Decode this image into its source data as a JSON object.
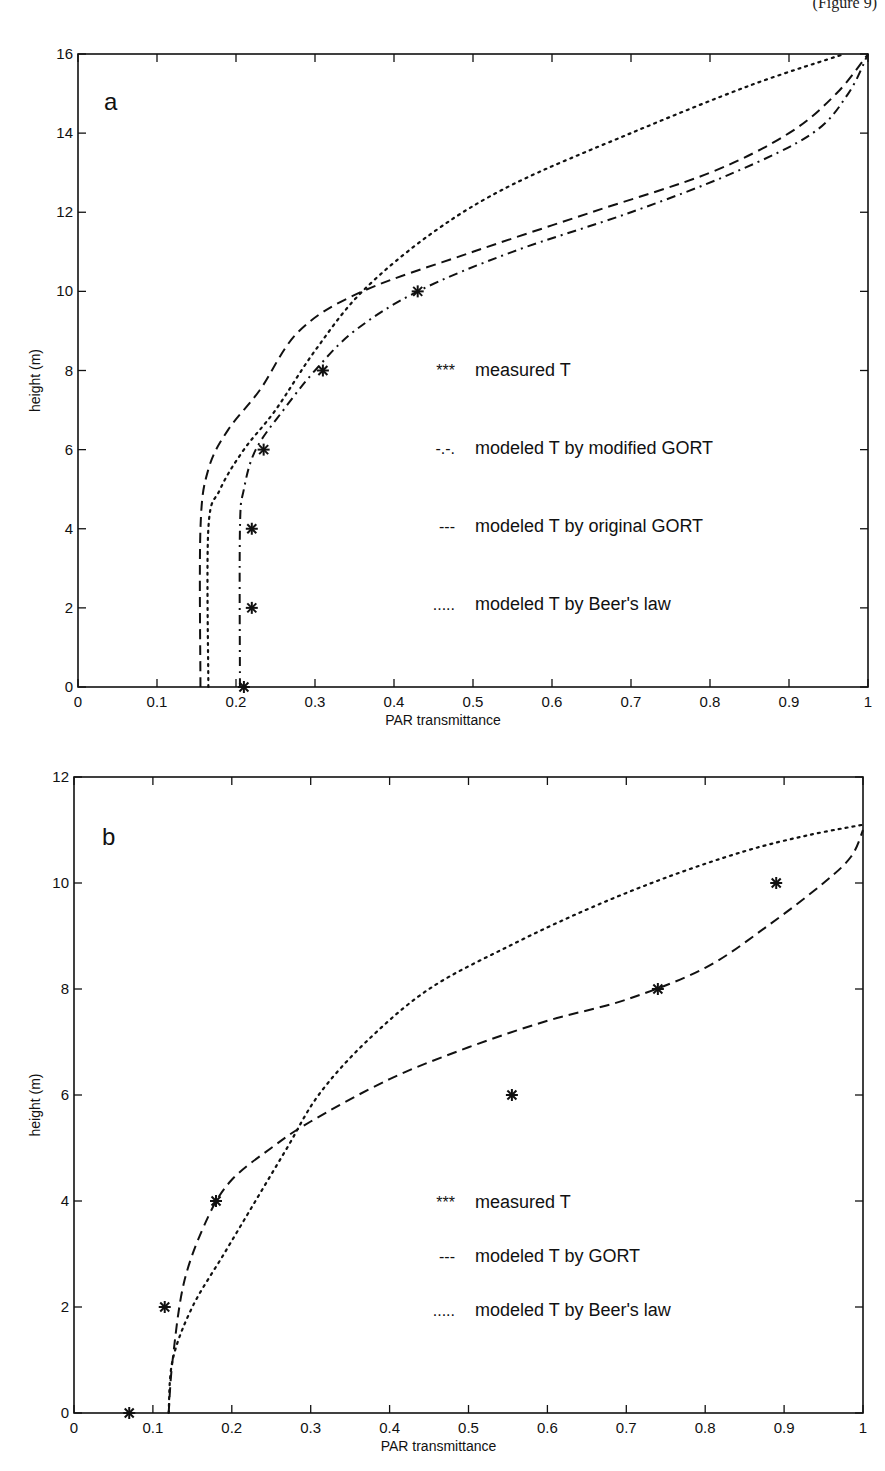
{
  "page": {
    "header_fragment": "(Figure 9)"
  },
  "chart_data": [
    {
      "type": "line",
      "panel_label": "a",
      "title": "",
      "xlabel": "PAR transmittance",
      "ylabel": "height (m)",
      "xlim": [
        0,
        1
      ],
      "ylim": [
        0,
        16
      ],
      "xticks": [
        "0",
        "0.1",
        "0.2",
        "0.3",
        "0.4",
        "0.5",
        "0.6",
        "0.7",
        "0.8",
        "0.9",
        "1"
      ],
      "yticks": [
        "0",
        "2",
        "4",
        "6",
        "8",
        "10",
        "12",
        "14",
        "16"
      ],
      "grid": false,
      "legend_position": "center-right",
      "series": [
        {
          "name": "measured T",
          "legend_symbol": "***",
          "style": "markers-asterisk",
          "points": [
            [
              0.21,
              0
            ],
            [
              0.22,
              2
            ],
            [
              0.22,
              4
            ],
            [
              0.235,
              6
            ],
            [
              0.31,
              8
            ],
            [
              0.43,
              10
            ]
          ]
        },
        {
          "name": "modeled T by modified GORT",
          "legend_symbol": "-.-.",
          "style": "dashdot",
          "points": [
            [
              0.205,
              0
            ],
            [
              0.205,
              4
            ],
            [
              0.21,
              5
            ],
            [
              0.225,
              6
            ],
            [
              0.26,
              7
            ],
            [
              0.3,
              8
            ],
            [
              0.35,
              9
            ],
            [
              0.43,
              10
            ],
            [
              0.55,
              11
            ],
            [
              0.7,
              12
            ],
            [
              0.83,
              13
            ],
            [
              0.93,
              14
            ],
            [
              0.975,
              15
            ],
            [
              1.0,
              16
            ]
          ]
        },
        {
          "name": "modeled T by original GORT",
          "legend_symbol": "---",
          "style": "dashed",
          "points": [
            [
              0.155,
              0
            ],
            [
              0.155,
              4
            ],
            [
              0.165,
              5.5
            ],
            [
              0.19,
              6.5
            ],
            [
              0.23,
              7.5
            ],
            [
              0.28,
              9
            ],
            [
              0.36,
              10
            ],
            [
              0.5,
              11
            ],
            [
              0.65,
              12
            ],
            [
              0.8,
              13
            ],
            [
              0.9,
              14
            ],
            [
              0.96,
              15
            ],
            [
              1.0,
              16
            ]
          ]
        },
        {
          "name": "modeled T by Beer's law",
          "legend_symbol": ".....",
          "style": "dotted",
          "points": [
            [
              0.165,
              0
            ],
            [
              0.165,
              4
            ],
            [
              0.18,
              5
            ],
            [
              0.21,
              6
            ],
            [
              0.25,
              7
            ],
            [
              0.3,
              8.5
            ],
            [
              0.36,
              10
            ],
            [
              0.45,
              11.5
            ],
            [
              0.55,
              12.7
            ],
            [
              0.7,
              14
            ],
            [
              0.85,
              15.2
            ],
            [
              0.97,
              16
            ]
          ]
        }
      ]
    },
    {
      "type": "line",
      "panel_label": "b",
      "title": "",
      "xlabel": "PAR transmittance",
      "ylabel": "height (m)",
      "xlim": [
        0,
        1
      ],
      "ylim": [
        0,
        12
      ],
      "xticks": [
        "0",
        "0.1",
        "0.2",
        "0.3",
        "0.4",
        "0.5",
        "0.6",
        "0.7",
        "0.8",
        "0.9",
        "1"
      ],
      "yticks": [
        "0",
        "2",
        "4",
        "6",
        "8",
        "10",
        "12"
      ],
      "grid": false,
      "legend_position": "lower-right",
      "series": [
        {
          "name": "measured T",
          "legend_symbol": "***",
          "style": "markers-asterisk",
          "points": [
            [
              0.07,
              0
            ],
            [
              0.115,
              2
            ],
            [
              0.18,
              4
            ],
            [
              0.555,
              6
            ],
            [
              0.74,
              8
            ],
            [
              0.89,
              10
            ]
          ]
        },
        {
          "name": "modeled T by GORT",
          "legend_symbol": "---",
          "style": "dashed",
          "points": [
            [
              0.12,
              0
            ],
            [
              0.125,
              1
            ],
            [
              0.14,
              2.5
            ],
            [
              0.17,
              3.7
            ],
            [
              0.2,
              4.4
            ],
            [
              0.25,
              5.0
            ],
            [
              0.3,
              5.5
            ],
            [
              0.4,
              6.3
            ],
            [
              0.5,
              6.9
            ],
            [
              0.6,
              7.4
            ],
            [
              0.7,
              7.8
            ],
            [
              0.8,
              8.4
            ],
            [
              0.88,
              9.2
            ],
            [
              0.95,
              10
            ],
            [
              0.985,
              10.5
            ],
            [
              1.0,
              11
            ]
          ]
        },
        {
          "name": "modeled T by Beer's law",
          "legend_symbol": ".....",
          "style": "dotted",
          "points": [
            [
              0.12,
              0
            ],
            [
              0.125,
              1
            ],
            [
              0.15,
              2
            ],
            [
              0.19,
              3
            ],
            [
              0.23,
              4
            ],
            [
              0.27,
              5
            ],
            [
              0.31,
              6
            ],
            [
              0.37,
              7
            ],
            [
              0.45,
              8
            ],
            [
              0.55,
              8.8
            ],
            [
              0.65,
              9.5
            ],
            [
              0.75,
              10.1
            ],
            [
              0.85,
              10.6
            ],
            [
              0.93,
              10.9
            ],
            [
              1.0,
              11.1
            ]
          ]
        }
      ]
    }
  ]
}
